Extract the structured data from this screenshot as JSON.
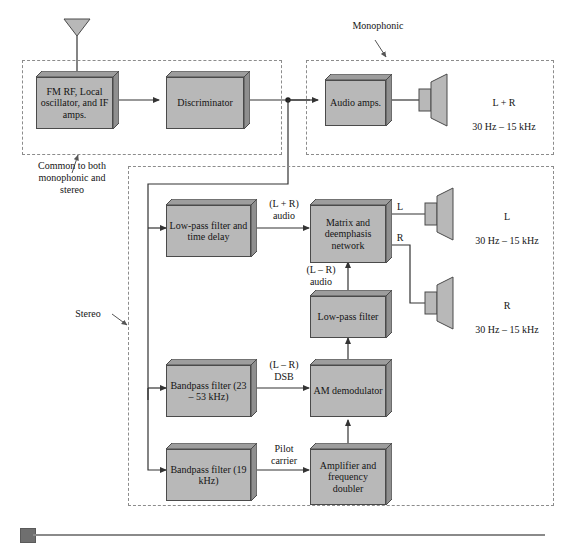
{
  "figure": {
    "colors": {
      "block_fill": "#b8b8b8",
      "block_side": "#8f8f8f",
      "block_stroke": "#4a4a4a",
      "wire": "#333333",
      "dashed_region": "#8c8c8c",
      "footer_square": "#6f6f6f",
      "footer_rule": "#8a8a8a",
      "background": "#ffffff"
    }
  },
  "regions": [
    {
      "id": "common",
      "label": "Common to both\nmonophonic and\nstereo"
    },
    {
      "id": "monophonic",
      "label": "Monophonic"
    },
    {
      "id": "stereo",
      "label": "Stereo"
    }
  ],
  "blocks": [
    {
      "id": "fm-rf",
      "label": "FM RF,\nLocal oscillator,\nand IF amps."
    },
    {
      "id": "discriminator",
      "label": "Discriminator"
    },
    {
      "id": "audio-amps",
      "label": "Audio\namps."
    },
    {
      "id": "lpf-delay",
      "label": "Low-pass filter\nand time delay"
    },
    {
      "id": "matrix",
      "label": "Matrix and\ndeemphasis\nnetwork"
    },
    {
      "id": "lpf-lr",
      "label": "Low-pass filter"
    },
    {
      "id": "bpf-23-53",
      "label": "Bandpass filter\n(23 – 53 kHz)"
    },
    {
      "id": "am-demod",
      "label": "AM\ndemodulator"
    },
    {
      "id": "bpf-19",
      "label": "Bandpass filter\n(19 kHz)"
    },
    {
      "id": "amp-doubler",
      "label": "Amplifier\nand\nfrequency\ndoubler"
    }
  ],
  "signal_labels": [
    {
      "id": "lpr-audio",
      "label": "(L + R)\naudio"
    },
    {
      "id": "lmr-audio",
      "label": "(L – R)\naudio"
    },
    {
      "id": "lmr-dsb",
      "label": "(L – R)\nDSB"
    },
    {
      "id": "pilot-carrier",
      "label": "Pilot\ncarrier"
    },
    {
      "id": "out-l",
      "label": "L"
    },
    {
      "id": "out-r",
      "label": "R"
    }
  ],
  "outputs": [
    {
      "id": "mono-out",
      "channel": "L + R",
      "range": "30 Hz – 15 kHz"
    },
    {
      "id": "left-out",
      "channel": "L",
      "range": "30 Hz – 15 kHz"
    },
    {
      "id": "right-out",
      "channel": "R",
      "range": "30 Hz – 15 kHz"
    }
  ],
  "icons": {
    "antenna": "antenna-icon",
    "speaker_mono": "speaker-icon",
    "speaker_left": "speaker-icon",
    "speaker_right": "speaker-icon"
  }
}
